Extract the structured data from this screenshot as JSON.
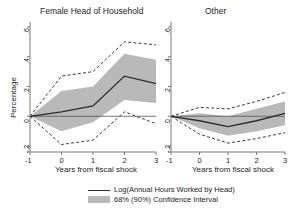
{
  "figure": {
    "ylabel": "Percentage",
    "xlabel": "Years from fiscal shock",
    "panels": [
      {
        "title": "Female Head of Household"
      },
      {
        "title": "Other"
      }
    ],
    "legend": {
      "line_label": "Log(Annual Hours Worked by Head)",
      "band_label": "68% (90%) Confidence Interval"
    },
    "colors": {
      "line": "#2b2b2b",
      "band": "#b9b9b9",
      "dashed": "#3a3a3a",
      "axis": "#7a7a7a"
    }
  },
  "chart_data": {
    "type": "line",
    "title": "",
    "xlabel": "Years from fiscal shock",
    "ylabel": "Percentage",
    "x": [
      -1,
      0,
      1,
      2,
      3
    ],
    "xticks": [
      "-1",
      "0",
      "1",
      "2",
      "3"
    ],
    "yticks": [
      "-.2",
      "0",
      ".2",
      ".4",
      ".6"
    ],
    "ytick_values": [
      -0.2,
      0,
      0.2,
      0.4,
      0.6
    ],
    "ylim": [
      -0.24,
      0.62
    ],
    "xlim": [
      -1,
      3
    ],
    "grid": false,
    "legend_position": "bottom",
    "panels": [
      {
        "name": "Female Head of Household",
        "series": [
          {
            "name": "Log(Annual Hours Worked by Head)",
            "values": [
              0.0,
              0.03,
              0.07,
              0.27,
              0.22
            ]
          },
          {
            "name": "68% CI upper",
            "values": [
              0.0,
              0.17,
              0.2,
              0.42,
              0.38
            ]
          },
          {
            "name": "68% CI lower",
            "values": [
              0.0,
              -0.1,
              -0.04,
              0.11,
              0.09
            ]
          },
          {
            "name": "90% CI upper",
            "values": [
              0.0,
              0.27,
              0.3,
              0.5,
              0.48
            ]
          },
          {
            "name": "90% CI lower",
            "values": [
              0.0,
              -0.19,
              -0.16,
              0.03,
              -0.05
            ]
          }
        ]
      },
      {
        "name": "Other",
        "series": [
          {
            "name": "Log(Annual Hours Worked by Head)",
            "values": [
              0.0,
              -0.03,
              -0.07,
              -0.03,
              0.02
            ]
          },
          {
            "name": "68% CI upper",
            "values": [
              0.0,
              0.02,
              0.0,
              0.05,
              0.1
            ]
          },
          {
            "name": "68% CI lower",
            "values": [
              0.0,
              -0.08,
              -0.13,
              -0.1,
              -0.06
            ]
          },
          {
            "name": "90% CI upper",
            "values": [
              0.0,
              0.06,
              0.05,
              0.1,
              0.16
            ]
          },
          {
            "name": "90% CI lower",
            "values": [
              0.0,
              -0.12,
              -0.18,
              -0.15,
              -0.11
            ]
          }
        ]
      }
    ]
  }
}
